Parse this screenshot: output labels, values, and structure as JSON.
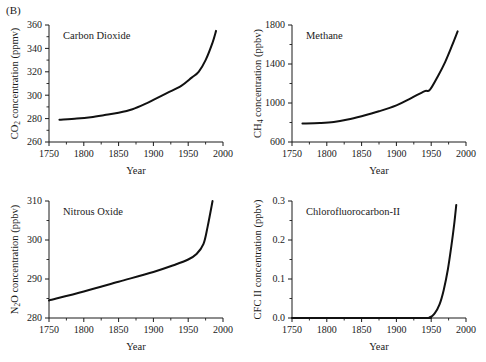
{
  "figure": {
    "letter": "(B)",
    "background_color": "#ffffff",
    "curve_color": "#111111",
    "axis_color": "#1a1a1a"
  },
  "chart_data": [
    {
      "type": "line",
      "title": "Carbon Dioxide",
      "xlabel": "Year",
      "ylabel": "CO2 concentration (ppmv)",
      "ylabel_parts": {
        "pre": "CO",
        "sub": "2",
        "post": " concentration (ppmv)"
      },
      "xlim": [
        1750,
        2000
      ],
      "ylim": [
        260,
        360
      ],
      "xticks": [
        1750,
        1800,
        1850,
        1900,
        1950,
        2000
      ],
      "yticks": [
        260,
        280,
        300,
        320,
        340,
        360
      ],
      "xminor": [
        1775,
        1825,
        1875,
        1925,
        1975
      ],
      "yminor": [
        270,
        290,
        310,
        330,
        350
      ],
      "grid": false,
      "legend": "none",
      "x": [
        1765,
        1790,
        1810,
        1830,
        1850,
        1870,
        1890,
        1900,
        1920,
        1940,
        1955,
        1965,
        1975,
        1985,
        1990
      ],
      "values": [
        279.0,
        280.0,
        281.2,
        283.0,
        285.0,
        288.0,
        293.0,
        296.0,
        302.0,
        308.0,
        315.0,
        320.0,
        330.0,
        345.0,
        355.0
      ]
    },
    {
      "type": "line",
      "title": "Methane",
      "xlabel": "Year",
      "ylabel": "CH4 concentration (ppbv)",
      "ylabel_parts": {
        "pre": "CH",
        "sub": "4",
        "post": " concentration (ppbv)"
      },
      "xlim": [
        1750,
        2000
      ],
      "ylim": [
        600,
        1800
      ],
      "xticks": [
        1750,
        1800,
        1850,
        1900,
        1950,
        2000
      ],
      "yticks": [
        600,
        1000,
        1400,
        1800
      ],
      "xminor": [
        1775,
        1825,
        1875,
        1925,
        1975
      ],
      "yminor": [
        800,
        1200,
        1600
      ],
      "grid": false,
      "legend": "none",
      "x": [
        1765,
        1790,
        1810,
        1830,
        1850,
        1875,
        1900,
        1920,
        1940,
        1948,
        1960,
        1970,
        1980,
        1988
      ],
      "values": [
        790,
        795,
        805,
        830,
        865,
        915,
        975,
        1045,
        1120,
        1135,
        1280,
        1420,
        1590,
        1735
      ]
    },
    {
      "type": "line",
      "title": "Nitrous Oxide",
      "xlabel": "Year",
      "ylabel": "N2O concentration (ppbv)",
      "ylabel_parts": {
        "pre": "N",
        "sub": "2",
        "post": "O concentration (ppbv)"
      },
      "xlim": [
        1750,
        2000
      ],
      "ylim": [
        280,
        310
      ],
      "xticks": [
        1750,
        1800,
        1850,
        1900,
        1950,
        2000
      ],
      "yticks": [
        280,
        290,
        300,
        310
      ],
      "xminor": [
        1775,
        1825,
        1875,
        1925,
        1975
      ],
      "yminor": [
        285,
        295,
        305
      ],
      "grid": false,
      "legend": "none",
      "x": [
        1750,
        1800,
        1850,
        1900,
        1930,
        1950,
        1962,
        1972,
        1978,
        1985
      ],
      "values": [
        284.5,
        286.8,
        289.3,
        291.8,
        293.6,
        295.0,
        296.4,
        299.0,
        303.5,
        310.0
      ]
    },
    {
      "type": "line",
      "title": "Chlorofluorocarbon-II",
      "xlabel": "Year",
      "ylabel": "CFC II concentration (ppbv)",
      "ylabel_parts": {
        "pre": "CFC II concentration (ppbv)",
        "sub": "",
        "post": ""
      },
      "xlim": [
        1750,
        2000
      ],
      "ylim": [
        0.0,
        0.3
      ],
      "xticks": [
        1750,
        1800,
        1850,
        1900,
        1950,
        2000
      ],
      "yticks": [
        "0.0",
        "0.1",
        "0.2",
        "0.3"
      ],
      "ytickvals": [
        0.0,
        0.1,
        0.2,
        0.3
      ],
      "xminor": [
        1775,
        1825,
        1875,
        1925,
        1975
      ],
      "yminor": [
        0.05,
        0.15,
        0.25
      ],
      "grid": false,
      "legend": "none",
      "x": [
        1750,
        1930,
        1948,
        1955,
        1962,
        1968,
        1974,
        1979,
        1983,
        1986
      ],
      "values": [
        0.0,
        0.0,
        0.002,
        0.012,
        0.035,
        0.072,
        0.125,
        0.185,
        0.24,
        0.29
      ]
    }
  ]
}
